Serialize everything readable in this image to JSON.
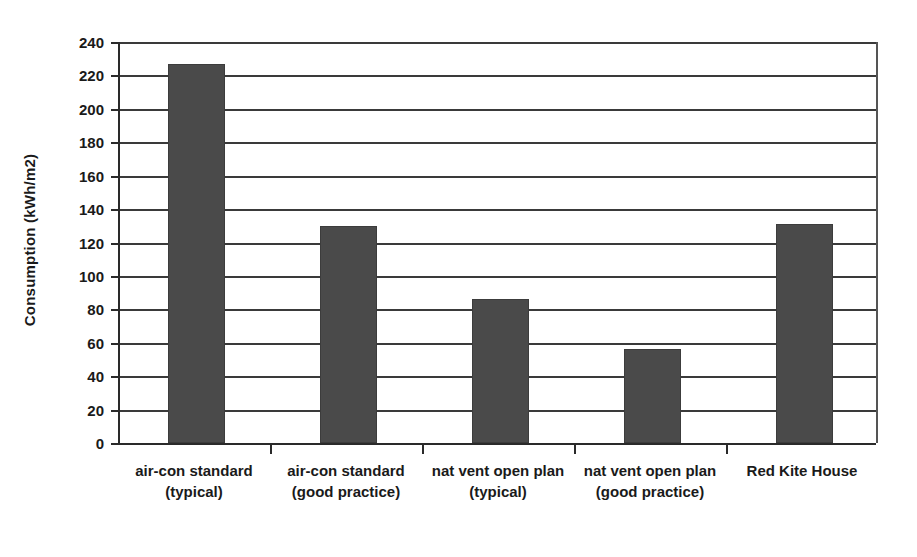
{
  "chart_data": {
    "type": "bar",
    "title": "",
    "xlabel": "",
    "ylabel": "Consumption (kWh/m2)",
    "categories": [
      "air-con standard (typical)",
      "air-con standard (good practice)",
      "nat vent open plan (typical)",
      "nat vent open plan (good practice)",
      "Red Kite House"
    ],
    "values": [
      227,
      130,
      86,
      56,
      131
    ],
    "ylim": [
      0,
      240
    ],
    "ytick_labels": [
      "240",
      "220",
      "200",
      "180",
      "160",
      "140",
      "120",
      "100",
      "80",
      "60",
      "40",
      "20",
      "0"
    ],
    "ytick_values": [
      240,
      220,
      200,
      180,
      160,
      140,
      120,
      100,
      80,
      60,
      40,
      20,
      0
    ],
    "grid": true,
    "legend": "none",
    "bar_color": "#4a4a4a",
    "axis_color": "#2a2a2a",
    "background": "#ffffff"
  }
}
